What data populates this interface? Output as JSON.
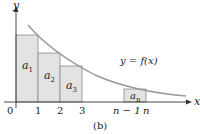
{
  "figure": {
    "caption": "(b)",
    "axes": {
      "x_label": "x",
      "y_label": "y"
    },
    "curve_label": "y = f(x)",
    "ticks": [
      "0",
      "1",
      "2",
      "3",
      "n − 1",
      "n"
    ],
    "rectangles": [
      {
        "label": "a",
        "sub": "1"
      },
      {
        "label": "a",
        "sub": "2"
      },
      {
        "label": "a",
        "sub": "3"
      },
      {
        "label": "a",
        "sub": "n"
      }
    ],
    "colors": {
      "rect_fill": "#e3e3e3",
      "rect_stroke": "#8a8a8a",
      "curve": "#9a9a9a",
      "axis": "#333333"
    }
  }
}
